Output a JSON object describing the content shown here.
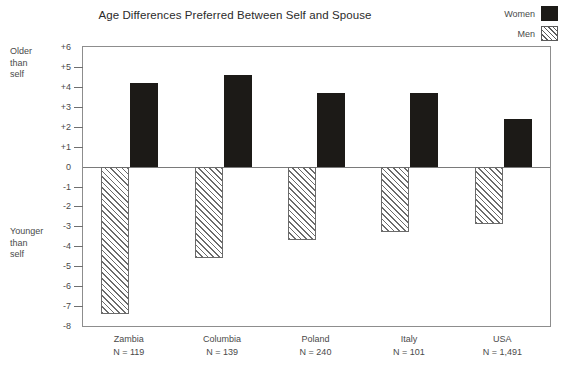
{
  "chart_data": {
    "type": "bar",
    "title": "Age Differences Preferred Between Self and Spouse",
    "xlabel": "",
    "ylabel": "",
    "ylim": [
      -8,
      6
    ],
    "ytick_labels": [
      "+6",
      "+5",
      "+4",
      "+3",
      "+2",
      "+1",
      "0",
      "-1",
      "-2",
      "-3",
      "-4",
      "-5",
      "-6",
      "-7",
      "-8"
    ],
    "yticks": [
      6,
      5,
      4,
      3,
      2,
      1,
      0,
      -1,
      -2,
      -3,
      -4,
      -5,
      -6,
      -7,
      -8
    ],
    "grid": false,
    "legend_position": "top-right",
    "categories": [
      "Zambia",
      "Columbia",
      "Poland",
      "Italy",
      "USA"
    ],
    "category_counts": [
      "N = 119",
      "N = 139",
      "N = 240",
      "N = 101",
      "N = 1,491"
    ],
    "series": [
      {
        "name": "Women",
        "values": [
          4.2,
          4.6,
          3.7,
          3.7,
          2.4
        ],
        "color": "#1c1a17",
        "fill": "solid"
      },
      {
        "name": "Men",
        "values": [
          -7.4,
          -4.6,
          -3.7,
          -3.3,
          -2.9
        ],
        "color": "#6b6b6b",
        "fill": "diagonal-hatch"
      }
    ],
    "annotations": {
      "upper_axis_note": "Older\nthan\nself",
      "lower_axis_note": "Younger\nthan\nself"
    }
  },
  "axis_notes": {
    "older": "Older than self",
    "older_lines": [
      "Older",
      "than",
      "self"
    ],
    "younger": "Younger than self",
    "younger_lines": [
      "Younger",
      "than",
      "self"
    ]
  },
  "legend": {
    "items": [
      {
        "label": "Women",
        "swatch": "solid-dark-square-icon"
      },
      {
        "label": "Men",
        "swatch": "diagonal-hatch-square-icon"
      }
    ]
  }
}
